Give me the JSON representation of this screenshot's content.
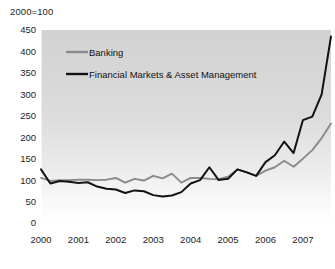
{
  "note": {
    "text": "2000=100"
  },
  "chart_data": {
    "type": "line",
    "title": "2000=100",
    "xlabel": "",
    "ylabel": "",
    "ylim": [
      0,
      450
    ],
    "ytick_values": [
      0,
      50,
      100,
      150,
      200,
      250,
      300,
      350,
      400,
      450
    ],
    "ytick_labels": [
      "0",
      "50",
      "100",
      "150",
      "200",
      "250",
      "300",
      "350",
      "400",
      "450"
    ],
    "xlim": [
      2000,
      2007.75
    ],
    "xtick_values": [
      2000,
      2001,
      2002,
      2003,
      2004,
      2005,
      2006,
      2007
    ],
    "xtick_labels": [
      "2000",
      "2001",
      "2002",
      "2003",
      "2004",
      "2005",
      "2006",
      "2007"
    ],
    "grid": false,
    "legend_position": "upper-left-inside",
    "x": [
      2000.0,
      2000.25,
      2000.5,
      2000.75,
      2001.0,
      2001.25,
      2001.5,
      2001.75,
      2002.0,
      2002.25,
      2002.5,
      2002.75,
      2003.0,
      2003.25,
      2003.5,
      2003.75,
      2004.0,
      2004.25,
      2004.5,
      2004.75,
      2005.0,
      2005.25,
      2005.5,
      2005.75,
      2006.0,
      2006.25,
      2006.5,
      2006.75,
      2007.0,
      2007.25,
      2007.5,
      2007.75
    ],
    "series": [
      {
        "name": "Banking",
        "color": "#8a8a8a",
        "values": [
          105,
          98,
          100,
          100,
          101,
          101,
          100,
          101,
          105,
          94,
          103,
          99,
          110,
          104,
          115,
          94,
          105,
          105,
          103,
          102,
          108,
          125,
          118,
          110,
          122,
          130,
          145,
          131,
          150,
          170,
          198,
          232
        ]
      },
      {
        "name": "Financial Markets & Asset Management",
        "color": "#121212",
        "values": [
          125,
          92,
          98,
          96,
          93,
          95,
          85,
          80,
          78,
          70,
          76,
          74,
          65,
          62,
          64,
          72,
          92,
          100,
          130,
          100,
          103,
          125,
          118,
          110,
          142,
          158,
          190,
          163,
          240,
          248,
          300,
          435
        ]
      }
    ]
  },
  "legend": {
    "entries": [
      {
        "label": "Banking",
        "color": "#8a8a8a"
      },
      {
        "label": "Financial Markets & Asset Management",
        "color": "#121212"
      }
    ]
  }
}
